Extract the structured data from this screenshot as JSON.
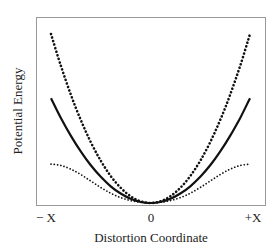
{
  "chart_data": {
    "type": "line",
    "title": "",
    "xlabel": "Distortion Coordinate",
    "ylabel": "Potential Energy",
    "x_tick_labels": [
      "− X",
      "0",
      "+X"
    ],
    "x_ticks": [
      -1,
      0,
      1
    ],
    "xlim": [
      -1.0,
      1.0
    ],
    "ylim": [
      0,
      1.06
    ],
    "grid": false,
    "legend": null,
    "x": [
      -1.0,
      -0.9,
      -0.8,
      -0.7,
      -0.6,
      -0.5,
      -0.4,
      -0.3,
      -0.2,
      -0.1,
      0.0,
      0.1,
      0.2,
      0.3,
      0.4,
      0.5,
      0.6,
      0.7,
      0.8,
      0.9,
      1.0
    ],
    "series": [
      {
        "name": "steep curve (heavy dotted)",
        "style": "dotted-heavy",
        "values": [
          1.0,
          0.81,
          0.64,
          0.49,
          0.36,
          0.25,
          0.16,
          0.09,
          0.04,
          0.01,
          0.0,
          0.01,
          0.04,
          0.09,
          0.16,
          0.25,
          0.36,
          0.49,
          0.64,
          0.81,
          1.0
        ]
      },
      {
        "name": "harmonic curve (solid)",
        "style": "solid",
        "values": [
          0.62,
          0.502,
          0.397,
          0.304,
          0.223,
          0.155,
          0.099,
          0.056,
          0.025,
          0.006,
          0.0,
          0.006,
          0.025,
          0.056,
          0.099,
          0.155,
          0.223,
          0.304,
          0.397,
          0.502,
          0.62
        ]
      },
      {
        "name": "flattened curve (fine dotted)",
        "style": "dotted-fine",
        "values": [
          0.23,
          0.222,
          0.2,
          0.168,
          0.13,
          0.092,
          0.058,
          0.032,
          0.014,
          0.004,
          0.0,
          0.004,
          0.014,
          0.032,
          0.058,
          0.092,
          0.13,
          0.168,
          0.2,
          0.222,
          0.23
        ]
      }
    ]
  },
  "colors": {
    "frame": "#999999",
    "curve": "#111111",
    "text": "#222222"
  }
}
